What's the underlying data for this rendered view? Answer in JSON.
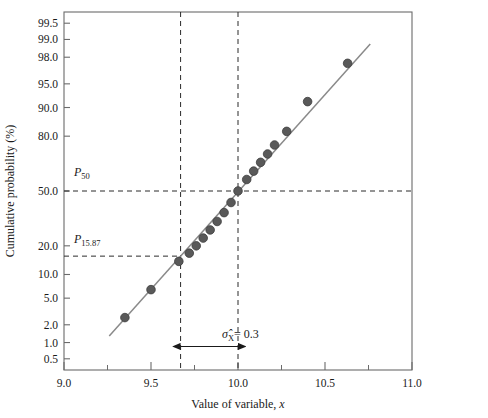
{
  "chart_data": {
    "type": "scatter",
    "title": "",
    "subtitle": "",
    "xlabel": "Value of variable, x",
    "ylabel": "Cumulative probability (%)",
    "xlim": [
      9.0,
      11.0
    ],
    "ylim_percent": [
      0.3,
      99.7
    ],
    "y_scale": "normal probability (probit)",
    "grid": false,
    "legend": null,
    "x_ticks_major": [
      "9.0",
      "9.5",
      "10.0",
      "10.5",
      "11.0"
    ],
    "x_tick_values": [
      9.0,
      9.5,
      10.0,
      10.5,
      11.0
    ],
    "x_ticks_minor": [
      9.25,
      9.75,
      10.25,
      10.75
    ],
    "y_ticks": [
      "99.5",
      "99.0",
      "98.0",
      "95.0",
      "90.0",
      "80.0",
      "50.0",
      "20.0",
      "10.0",
      "5.0",
      "2.0",
      "1.0",
      "0.5"
    ],
    "y_tick_values": [
      99.5,
      99.0,
      98.0,
      95.0,
      90.0,
      80.0,
      50.0,
      20.0,
      10.0,
      5.0,
      2.0,
      1.0,
      0.5
    ],
    "x": [
      9.35,
      9.5,
      9.66,
      9.72,
      9.76,
      9.8,
      9.84,
      9.88,
      9.92,
      9.96,
      10.0,
      10.05,
      10.09,
      10.13,
      10.17,
      10.21,
      10.28,
      10.4,
      10.63
    ],
    "y": [
      2.6,
      6.5,
      14.0,
      17.0,
      20.0,
      23.5,
      27.5,
      32.0,
      37.0,
      43.0,
      50.0,
      57.0,
      62.0,
      67.0,
      71.5,
      76.0,
      82.0,
      91.5,
      97.5
    ],
    "fit_line": {
      "label": "least-squares fit",
      "x_start": 9.26,
      "y_start": 1.3,
      "x_end": 10.76,
      "y_end": 98.8
    },
    "reference_lines": [
      {
        "name": "P50",
        "label": "P",
        "sub": "50",
        "orientation": "horizontal",
        "y_percent": 50.0,
        "style": "dashed"
      },
      {
        "name": "P15.87",
        "label": "P",
        "sub": "15.87",
        "orientation": "horizontal",
        "y_percent": 15.87,
        "style": "dashed"
      },
      {
        "name": "x-at-P50",
        "orientation": "vertical",
        "x_value": 10.0,
        "style": "dashed"
      },
      {
        "name": "x-at-P15.87",
        "orientation": "vertical",
        "x_value": 9.67,
        "style": "dashed"
      }
    ],
    "annotations": [
      {
        "name": "sigma-hat",
        "text": "σ̂",
        "subscript": "X",
        "equals_value": "= 0.3",
        "full_text": "σ̂X = 0.3",
        "arrow": "double-headed",
        "from_x": 9.67,
        "to_x": 10.0,
        "at_y_percent": 0.85
      }
    ]
  },
  "labels": {
    "p50": {
      "base": "P",
      "sub": "50"
    },
    "p1587": {
      "base": "P",
      "sub": "15.87"
    },
    "sigma": {
      "glyph": "σ̂",
      "sub": "X",
      "value": "= 0.3"
    }
  },
  "colors": {
    "marker_fill": "#595959",
    "marker_stroke": "#3d3d3d",
    "fit_line": "#8a8a8a",
    "axis": "#6b6b6b",
    "dashed": "#2b2b2b",
    "text": "#1a1a1a",
    "background": "#ffffff"
  }
}
